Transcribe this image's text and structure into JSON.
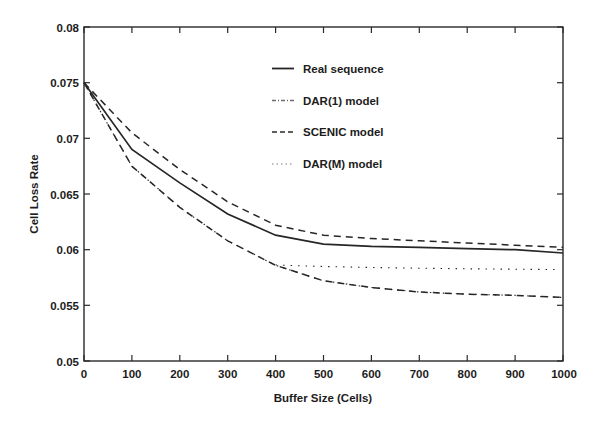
{
  "chart_data": {
    "type": "line",
    "title": "",
    "xlabel": "Buffer Size (Cells)",
    "ylabel": "Cell Loss Rate",
    "xlim": [
      0,
      1000
    ],
    "ylim": [
      0.05,
      0.08
    ],
    "grid": false,
    "legend_position": "upper-center-right",
    "xticks": [
      0,
      100,
      200,
      300,
      400,
      500,
      600,
      700,
      800,
      900,
      1000
    ],
    "xtick_labels": [
      "0",
      "100",
      "200",
      "300",
      "400",
      "500",
      "600",
      "700",
      "800",
      "900",
      "1000"
    ],
    "yticks": [
      0.05,
      0.055,
      0.06,
      0.065,
      0.07,
      0.075,
      0.08
    ],
    "ytick_labels": [
      "0.05",
      "0.055",
      "0.06",
      "0.065",
      "0.07",
      "0.075",
      "0.08"
    ],
    "x": [
      0,
      100,
      200,
      300,
      400,
      500,
      600,
      700,
      800,
      900,
      1000
    ],
    "series": [
      {
        "name": "Real sequence",
        "style": "solid",
        "values": [
          0.075,
          0.069,
          0.066,
          0.0632,
          0.0613,
          0.0605,
          0.0603,
          0.0602,
          0.0601,
          0.06,
          0.0597
        ]
      },
      {
        "name": "DAR(1) model",
        "style": "dashdot",
        "values": [
          0.075,
          0.069,
          0.066,
          0.0632,
          0.0613,
          0.0605,
          0.0603,
          0.0602,
          0.0601,
          0.06,
          0.0597
        ]
      },
      {
        "name": "SCENIC model",
        "style": "dashed",
        "values": [
          0.075,
          0.0705,
          0.0672,
          0.0643,
          0.0622,
          0.0613,
          0.061,
          0.0608,
          0.0606,
          0.0604,
          0.0602
        ]
      },
      {
        "name": "DAR(M) model",
        "style": "dotted",
        "values": [
          0.075,
          0.0675,
          0.0638,
          0.0608,
          0.0586,
          0.0572,
          0.0566,
          0.0562,
          0.056,
          0.0559,
          0.0557
        ]
      }
    ],
    "extra_series": [
      {
        "name": "lower-dashed-bound",
        "style": "dashed",
        "values": [
          0.075,
          0.0675,
          0.0638,
          0.0608,
          0.0586,
          0.0572,
          0.0566,
          0.0562,
          0.056,
          0.0559,
          0.0557
        ]
      }
    ]
  },
  "legend": {
    "items": [
      {
        "label": "Real sequence",
        "style": "solid"
      },
      {
        "label": "DAR(1) model",
        "style": "dashdot"
      },
      {
        "label": "SCENIC model",
        "style": "dashed"
      },
      {
        "label": "DAR(M) model",
        "style": "dotted"
      }
    ]
  },
  "colors": {
    "line": "#262626",
    "axis": "#2a2a2a",
    "background": "#ffffff",
    "faint_line": "#b9b9b9"
  }
}
